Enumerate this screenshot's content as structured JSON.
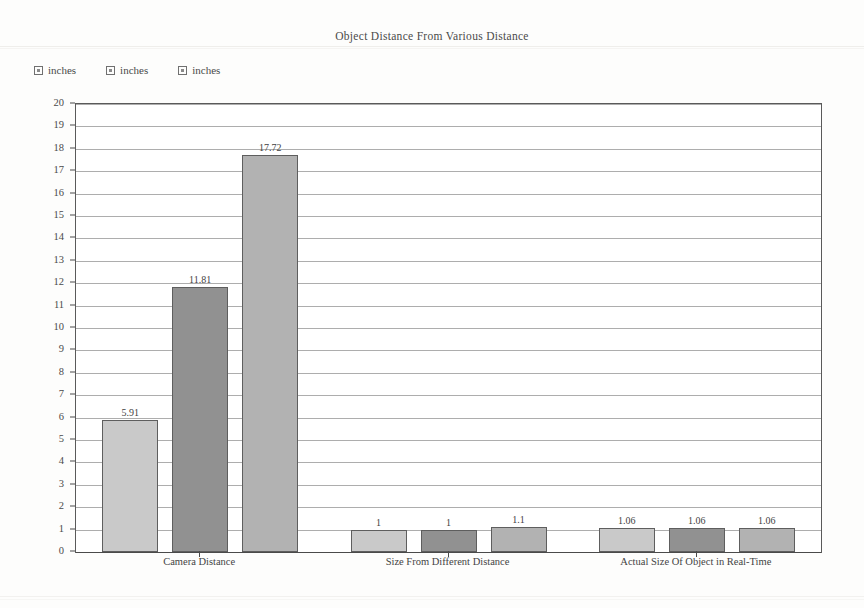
{
  "chart_data": {
    "type": "bar",
    "title": "Object Distance From Various Distance",
    "xlabel": "",
    "ylabel": "",
    "ylim": [
      0,
      20
    ],
    "ytick_step": 1,
    "grid": true,
    "legend_position": "top-left",
    "categories": [
      "Camera Distance",
      "Size From Different Distance",
      "Actual Size Of Object in Real-Time"
    ],
    "series": [
      {
        "name": "inches",
        "color": "#c9c9c9",
        "values": [
          5.91,
          11.81,
          17.72
        ]
      },
      {
        "name": "inches",
        "color": "#919191",
        "values": [
          1,
          1,
          1.1
        ]
      },
      {
        "name": "inches",
        "color": "#b2b2b2",
        "values": [
          1.06,
          1.06,
          1.06
        ]
      }
    ],
    "bar_groups": [
      {
        "category": "Camera Distance",
        "bars": [
          {
            "series": "inches",
            "value": 5.91,
            "label": "5.91",
            "shade": 0
          },
          {
            "series": "inches",
            "value": 11.81,
            "label": "11.81",
            "shade": 1
          },
          {
            "series": "inches",
            "value": 17.72,
            "label": "17.72",
            "shade": 2
          }
        ]
      },
      {
        "category": "Size From Different Distance",
        "bars": [
          {
            "series": "inches",
            "value": 1,
            "label": "1",
            "shade": 0
          },
          {
            "series": "inches",
            "value": 1,
            "label": "1",
            "shade": 1
          },
          {
            "series": "inches",
            "value": 1.1,
            "label": "1.1",
            "shade": 2
          }
        ]
      },
      {
        "category": "Actual Size Of Object in Real-Time",
        "bars": [
          {
            "series": "inches",
            "value": 1.06,
            "label": "1.06",
            "shade": 0
          },
          {
            "series": "inches",
            "value": 1.06,
            "label": "1.06",
            "shade": 1
          },
          {
            "series": "inches",
            "value": 1.06,
            "label": "1.06",
            "shade": 2
          }
        ]
      }
    ],
    "ytick_labels": [
      "0",
      "1",
      "2",
      "3",
      "4",
      "5",
      "6",
      "7",
      "8",
      "9",
      "10",
      "11",
      "12",
      "13",
      "14",
      "15",
      "16",
      "17",
      "18",
      "19",
      "20"
    ]
  },
  "legend": {
    "items": [
      {
        "label": "inches"
      },
      {
        "label": "inches"
      },
      {
        "label": "inches"
      }
    ]
  }
}
